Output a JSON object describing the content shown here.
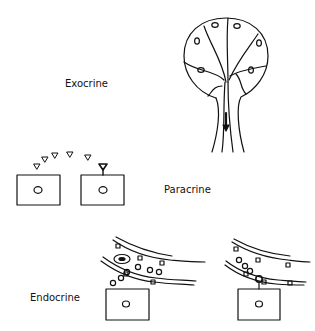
{
  "labels": {
    "exocrine": "Exocrine",
    "paracrine": "Paracrine",
    "endocrine": "Endocrine"
  },
  "colors": {
    "stroke": "#111111",
    "background": "#ffffff"
  }
}
